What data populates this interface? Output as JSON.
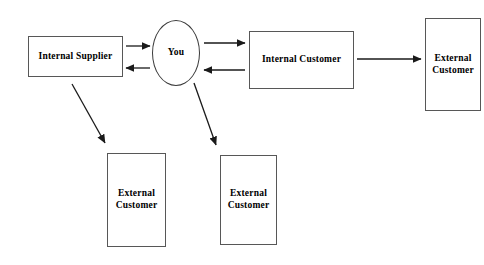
{
  "diagram": {
    "background_color": "#ffffff",
    "border_color": "#575757",
    "text_color": "#000000",
    "arrow_color": "#1a1a1a",
    "nodes": {
      "internal_supplier": {
        "label": "Internal Supplier",
        "shape": "rectangle",
        "x": 28,
        "y": 36,
        "w": 95,
        "h": 41,
        "font_size": 9.5
      },
      "you": {
        "label": "You",
        "shape": "ellipse",
        "x": 152,
        "y": 20,
        "w": 48,
        "h": 66,
        "font_size": 9.5
      },
      "internal_customer": {
        "label": "Internal Customer",
        "shape": "rectangle",
        "x": 249,
        "y": 31,
        "w": 105,
        "h": 58,
        "font_size": 9.5
      },
      "external_customer_right": {
        "label": "External Customer",
        "shape": "rectangle",
        "x": 425,
        "y": 18,
        "w": 56,
        "h": 93,
        "font_size": 9.5
      },
      "external_customer_bottom_left": {
        "label": "External Customer",
        "shape": "rectangle",
        "x": 107,
        "y": 153,
        "w": 59,
        "h": 94,
        "font_size": 9.5
      },
      "external_customer_bottom_middle": {
        "label": "External Customer",
        "shape": "rectangle",
        "x": 220,
        "y": 155,
        "w": 57,
        "h": 90,
        "font_size": 9.5
      }
    },
    "arrows": [
      {
        "name": "supplier-to-you",
        "from": "internal_supplier",
        "to": "you",
        "direction": "right",
        "x1": 126,
        "y1": 46,
        "x2": 150,
        "y2": 46
      },
      {
        "name": "you-to-supplier",
        "from": "you",
        "to": "internal_supplier",
        "direction": "left",
        "x1": 150,
        "y1": 68,
        "x2": 126,
        "y2": 68
      },
      {
        "name": "you-to-internal-customer",
        "from": "you",
        "to": "internal_customer",
        "direction": "right",
        "x1": 204,
        "y1": 43,
        "x2": 245,
        "y2": 43
      },
      {
        "name": "internal-customer-to-you",
        "from": "internal_customer",
        "to": "you",
        "direction": "left",
        "x1": 245,
        "y1": 70,
        "x2": 204,
        "y2": 70
      },
      {
        "name": "internal-customer-to-external-customer",
        "from": "internal_customer",
        "to": "external_customer_right",
        "direction": "right",
        "x1": 357,
        "y1": 59,
        "x2": 421,
        "y2": 59
      },
      {
        "name": "supplier-to-external-customer-bottom-left",
        "from": "internal_supplier",
        "to": "external_customer_bottom_left",
        "direction": "diagonal-down-right",
        "x1": 72,
        "y1": 84,
        "x2": 105,
        "y2": 143
      },
      {
        "name": "you-to-external-customer-bottom-middle",
        "from": "you",
        "to": "external_customer_bottom_middle",
        "direction": "diagonal-down-right",
        "x1": 194,
        "y1": 83,
        "x2": 216,
        "y2": 145
      }
    ]
  }
}
